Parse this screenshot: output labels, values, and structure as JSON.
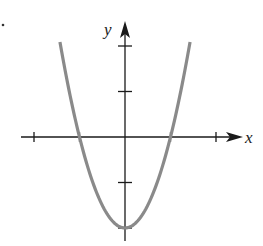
{
  "chart_data": {
    "type": "line",
    "title": "",
    "xlabel": "x",
    "ylabel": "y",
    "function": "y = 2x^2 - 2",
    "xlim": [
      -2.3,
      2.6
    ],
    "ylim": [
      -2.3,
      2.5
    ],
    "x_ticks": [
      -2,
      -1,
      1,
      2
    ],
    "y_ticks": [
      -1,
      1,
      2
    ],
    "tick_labels_shown": false,
    "grid": false,
    "legend": null,
    "series": [
      {
        "name": "parabola",
        "color": "#8a8a8a",
        "x": [
          -1.41,
          -1.2,
          -1.0,
          -0.8,
          -0.6,
          -0.4,
          -0.2,
          0,
          0.2,
          0.4,
          0.6,
          0.8,
          1.0,
          1.2,
          1.41
        ],
        "y": [
          2.0,
          0.88,
          0.0,
          -0.72,
          -1.28,
          -1.68,
          -1.92,
          -2.0,
          -1.92,
          -1.68,
          -1.28,
          -0.72,
          0.0,
          0.88,
          2.0
        ]
      }
    ],
    "key_points": {
      "vertex": [
        0,
        -2
      ],
      "x_intercepts": [
        -1,
        1
      ],
      "y_intercept": -2
    }
  },
  "labels": {
    "x": "x",
    "y": "y"
  },
  "colors": {
    "axis": "#1a1a1a",
    "curve": "#8a8a8a"
  },
  "layout": {
    "origin_px": [
      125,
      137
    ],
    "unit_px": 45.5
  }
}
